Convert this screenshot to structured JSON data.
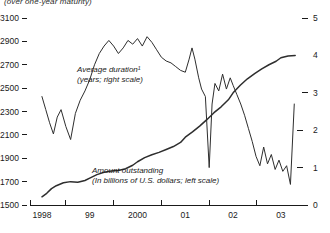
{
  "subtitle": "(over one-year maturity)",
  "chart_data": {
    "type": "line",
    "title": "",
    "subtitle": "(over one-year maturity)",
    "xlabel": "",
    "grid": false,
    "legend": "annotations-inline",
    "x_axis": {
      "tick_labels": [
        "1998",
        "99",
        "2000",
        "01",
        "02",
        "03"
      ],
      "tick_values": [
        1998,
        1999,
        2000,
        2001,
        2002,
        2003
      ],
      "range": [
        1997.75,
        2003.4
      ],
      "minor_ticks_between_labels": true
    },
    "left_axis": {
      "label": "Amount outstanding (In billions of U.S. dollars; left scale)",
      "ylim": [
        1500,
        3100
      ],
      "tick_labels": [
        "1500",
        "1700",
        "1900",
        "2100",
        "2300",
        "2500",
        "2700",
        "2900",
        "3100"
      ],
      "tick_values": [
        1500,
        1700,
        1900,
        2100,
        2300,
        2500,
        2700,
        2900,
        3100
      ]
    },
    "right_axis": {
      "label": "Average duration (years; right scale)",
      "ylim": [
        0,
        5
      ],
      "tick_labels": [
        "0",
        "1",
        "2",
        "3",
        "4",
        "5"
      ],
      "tick_values": [
        0,
        1,
        2,
        3,
        4,
        5
      ]
    },
    "annotations": [
      {
        "name": "average-duration-label",
        "line1": "Average duration¹",
        "line2": "(years; right scale)",
        "x": 77,
        "y": 72
      },
      {
        "name": "amount-outstanding-label",
        "line1": "Amount outstanding",
        "line2": "(In billions of U.S. dollars; left scale)",
        "x": 92,
        "y": 173
      }
    ],
    "series": [
      {
        "name": "Amount outstanding",
        "axis": "left",
        "units": "billions of U.S. dollars",
        "color": "#2e2e2e",
        "x": [
          1998.0,
          1998.1,
          1998.2,
          1998.3,
          1998.45,
          1998.6,
          1998.75,
          1998.9,
          1999.0,
          1999.15,
          1999.3,
          1999.45,
          1999.6,
          1999.75,
          1999.9,
          2000.0,
          2000.15,
          2000.3,
          2000.45,
          2000.6,
          2000.75,
          2000.9,
          2001.0,
          2001.15,
          2001.3,
          2001.45,
          2001.6,
          2001.75,
          2001.9,
          2002.0,
          2002.15,
          2002.3,
          2002.45,
          2002.6,
          2002.75,
          2002.9,
          2003.0,
          2003.15,
          2003.3
        ],
        "values": [
          1570,
          1600,
          1640,
          1665,
          1690,
          1700,
          1695,
          1710,
          1730,
          1760,
          1780,
          1790,
          1795,
          1810,
          1840,
          1870,
          1905,
          1930,
          1950,
          1975,
          2000,
          2035,
          2080,
          2125,
          2175,
          2230,
          2290,
          2340,
          2400,
          2460,
          2525,
          2580,
          2625,
          2665,
          2700,
          2730,
          2760,
          2775,
          2780
        ]
      },
      {
        "name": "Average duration",
        "axis": "right",
        "units": "years",
        "color": "#2e2e2e",
        "x": [
          1998.0,
          1998.08,
          1998.16,
          1998.24,
          1998.32,
          1998.4,
          1998.5,
          1998.6,
          1998.7,
          1998.8,
          1998.9,
          1999.0,
          1999.1,
          1999.2,
          1999.3,
          1999.4,
          1999.5,
          1999.6,
          1999.7,
          1999.8,
          1999.9,
          2000.0,
          2000.1,
          2000.2,
          2000.3,
          2000.4,
          2000.5,
          2000.6,
          2000.7,
          2000.8,
          2000.9,
          2001.0,
          2001.08,
          2001.14,
          2001.2,
          2001.28,
          2001.34,
          2001.42,
          2001.5,
          2001.56,
          2001.62,
          2001.7,
          2001.78,
          2001.86,
          2001.94,
          2002.0,
          2002.08,
          2002.16,
          2002.24,
          2002.32,
          2002.4,
          2002.48,
          2002.56,
          2002.64,
          2002.72,
          2002.8,
          2002.88,
          2002.96,
          2003.04,
          2003.12,
          2003.2,
          2003.28
        ],
        "values": [
          2.9,
          2.55,
          2.2,
          1.9,
          2.35,
          2.55,
          2.1,
          1.75,
          2.45,
          2.8,
          3.05,
          3.35,
          3.75,
          4.05,
          4.25,
          4.4,
          4.25,
          4.05,
          4.2,
          4.4,
          4.3,
          4.45,
          4.25,
          4.5,
          4.35,
          4.15,
          3.95,
          3.85,
          3.8,
          3.7,
          3.6,
          3.55,
          3.9,
          4.2,
          3.9,
          3.4,
          3.1,
          2.9,
          1.0,
          2.7,
          3.25,
          3.05,
          3.5,
          3.1,
          3.4,
          3.2,
          2.95,
          2.7,
          2.4,
          2.05,
          1.7,
          1.3,
          1.05,
          1.55,
          1.1,
          1.35,
          0.95,
          1.2,
          0.9,
          1.05,
          0.55,
          2.7
        ]
      }
    ]
  }
}
